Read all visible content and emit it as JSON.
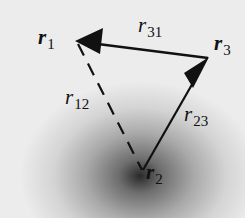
{
  "diagram": {
    "type": "vector-triangle",
    "nodes": [
      {
        "id": "r1",
        "symbol": "r",
        "subscript": "1",
        "x": 77,
        "y": 42
      },
      {
        "id": "r2",
        "symbol": "r",
        "subscript": "2",
        "x": 142,
        "y": 172
      },
      {
        "id": "r3",
        "symbol": "r",
        "subscript": "3",
        "x": 208,
        "y": 58
      }
    ],
    "edges": [
      {
        "id": "r31",
        "symbol": "r",
        "subscript": "31",
        "from": "r3",
        "to": "r1",
        "style": "solid",
        "arrow": "end"
      },
      {
        "id": "r23",
        "symbol": "r",
        "subscript": "23",
        "from": "r2",
        "to": "r3",
        "style": "solid",
        "arrow": "end"
      },
      {
        "id": "r12",
        "symbol": "r",
        "subscript": "12",
        "from": "r1",
        "to": "r2",
        "style": "dashed",
        "arrow": "none"
      }
    ],
    "colors": {
      "line": "#111111",
      "background_light": "#ececec",
      "background_dark": "#2a2a2a"
    }
  }
}
